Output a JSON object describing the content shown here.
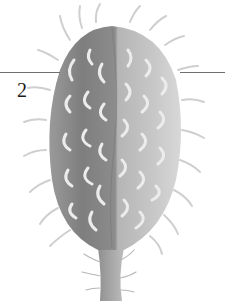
{
  "plate": {
    "figure_label": "2",
    "caption_fragment": "",
    "subject": "spiny ovoid fruit capsule illustration",
    "colors": {
      "background": "#ffffff",
      "shadow_side": "#8a8a8a",
      "light_side": "#c4c4c4",
      "spine": "#e6e6e6",
      "leader_line": "#6f6f6f",
      "label": "#1a1a1a"
    }
  }
}
